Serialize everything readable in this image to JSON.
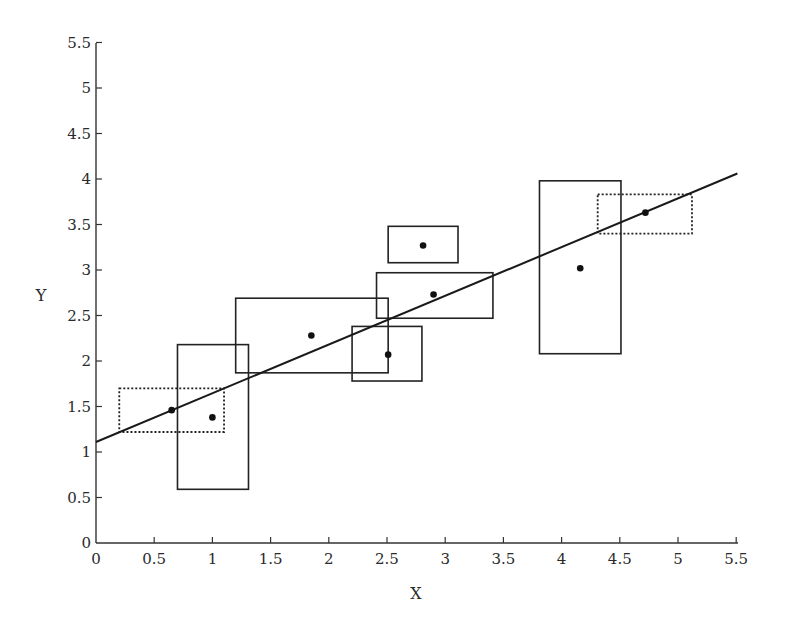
{
  "chart_data": {
    "type": "scatter",
    "title": "",
    "xlabel": "X",
    "ylabel": "Y",
    "xlim": [
      0,
      5.5
    ],
    "ylim": [
      0,
      5.5
    ],
    "grid": false,
    "legend": null,
    "x_ticks": [
      "0",
      "0.5",
      "1",
      "1.5",
      "2",
      "2.5",
      "3",
      "3.5",
      "4",
      "4.5",
      "5",
      "5.5"
    ],
    "y_ticks": [
      "0",
      "0.5",
      "1",
      "1.5",
      "2",
      "2.5",
      "3",
      "3.5",
      "4",
      "4.5",
      "5",
      "5.5"
    ],
    "points": [
      {
        "x": 0.65,
        "y": 1.46,
        "box": {
          "x0": 0.2,
          "x1": 1.1,
          "y0": 1.22,
          "y1": 1.7,
          "style": "dotted"
        }
      },
      {
        "x": 1.0,
        "y": 1.38,
        "box": {
          "x0": 0.7,
          "x1": 1.31,
          "y0": 0.59,
          "y1": 2.18,
          "style": "solid"
        }
      },
      {
        "x": 1.85,
        "y": 2.28,
        "box": {
          "x0": 1.2,
          "x1": 2.51,
          "y0": 1.87,
          "y1": 2.69,
          "style": "solid"
        }
      },
      {
        "x": 2.51,
        "y": 2.07,
        "box": {
          "x0": 2.2,
          "x1": 2.8,
          "y0": 1.78,
          "y1": 2.38,
          "style": "solid"
        }
      },
      {
        "x": 2.81,
        "y": 3.27,
        "box": {
          "x0": 2.51,
          "x1": 3.11,
          "y0": 3.08,
          "y1": 3.48,
          "style": "solid"
        }
      },
      {
        "x": 2.9,
        "y": 2.73,
        "box": {
          "x0": 2.41,
          "x1": 3.41,
          "y0": 2.47,
          "y1": 2.97,
          "style": "solid"
        }
      },
      {
        "x": 4.16,
        "y": 3.02,
        "box": {
          "x0": 3.81,
          "x1": 4.51,
          "y0": 2.08,
          "y1": 3.98,
          "style": "solid"
        }
      },
      {
        "x": 4.72,
        "y": 3.63,
        "box": {
          "x0": 4.31,
          "x1": 5.12,
          "y0": 3.4,
          "y1": 3.83,
          "style": "dotted"
        }
      }
    ],
    "fit_line": {
      "x0": 0,
      "y0": 1.11,
      "x1": 5.51,
      "y1": 4.06,
      "slope": 0.535,
      "intercept": 1.11
    }
  }
}
